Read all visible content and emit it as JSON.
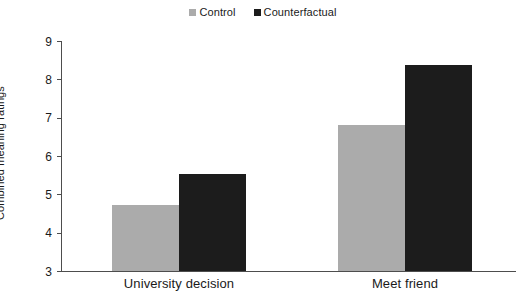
{
  "chart_data": {
    "type": "bar",
    "title": "",
    "subtitle": "",
    "xlabel": "",
    "ylabel": "Combined meaning ratings",
    "categories": [
      "University decision",
      "Meet friend"
    ],
    "series": [
      {
        "name": "Control",
        "values": [
          4.73,
          6.81
        ],
        "color": "#ababab"
      },
      {
        "name": "Counterfactual",
        "values": [
          5.52,
          8.38
        ],
        "color": "#1c1c1c"
      }
    ],
    "ylim": [
      3,
      9
    ],
    "yticks": [
      3,
      4,
      5,
      6,
      7,
      8,
      9
    ],
    "ytick_labels": [
      "3",
      "4",
      "5",
      "6",
      "7",
      "8",
      "9"
    ],
    "grid": false,
    "legend_position": "top-center",
    "axis_color": "#4d4d4d",
    "background": "#ffffff"
  },
  "legend": {
    "entries": [
      {
        "label": "Control",
        "swatch_name": "legend-swatch-control"
      },
      {
        "label": "Counterfactual",
        "swatch_name": "legend-swatch-counterfactual"
      }
    ]
  },
  "axes": {
    "y_title": "Combined meaning ratings",
    "y_ticks": [
      "9",
      "8",
      "7",
      "6",
      "5",
      "4",
      "3"
    ],
    "x_categories": [
      "University decision",
      "Meet friend"
    ]
  }
}
